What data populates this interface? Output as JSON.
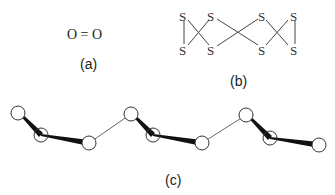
{
  "panel_a": {
    "formula": "O = O",
    "label": "(a)"
  },
  "panel_b": {
    "atom_symbol": "S",
    "label": "(b)",
    "atoms": [
      {
        "id": "s1",
        "x": 184,
        "y": 16
      },
      {
        "id": "s2",
        "x": 184,
        "y": 50
      },
      {
        "id": "s3",
        "x": 212,
        "y": 16
      },
      {
        "id": "s4",
        "x": 212,
        "y": 50
      },
      {
        "id": "s5",
        "x": 262,
        "y": 16
      },
      {
        "id": "s6",
        "x": 262,
        "y": 50
      },
      {
        "id": "s7",
        "x": 292,
        "y": 16
      },
      {
        "id": "s8",
        "x": 292,
        "y": 50
      }
    ]
  },
  "panel_c": {
    "label": "(c)",
    "nodes": [
      {
        "x": 18,
        "y": 113
      },
      {
        "x": 41,
        "y": 135
      },
      {
        "x": 89,
        "y": 143
      },
      {
        "x": 131,
        "y": 114
      },
      {
        "x": 153,
        "y": 135
      },
      {
        "x": 202,
        "y": 143
      },
      {
        "x": 246,
        "y": 115
      },
      {
        "x": 270,
        "y": 138
      },
      {
        "x": 319,
        "y": 145
      }
    ]
  }
}
